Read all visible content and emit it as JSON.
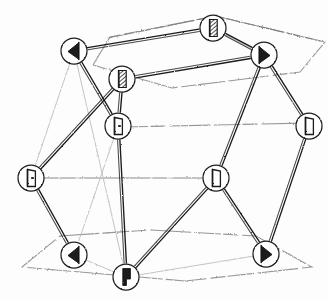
{
  "figure": {
    "caption": "",
    "background_color": "#fdfdfd",
    "ink_color": "#1a1a1a",
    "faint_ink_color": "#b9b9b9",
    "mid_ink_color": "#6f6f6f",
    "node_fill": "#ffffff",
    "node_stroke": "#1f1f1f"
  },
  "legend": {
    "glyph_names": {
      "flag-left-filled": "flag pointing left, solid",
      "flag-right-filled": "flag pointing right, solid",
      "flag-hatched": "flag with diagonal hatching",
      "flag-outline": "flag outline, empty",
      "flag-outline-dot": "flag outline with centre dot",
      "flag-vertical-solid": "vertical flag, solid black"
    }
  },
  "chart_data": {
    "type": "diagram",
    "layout": "cube-skeleton-graph",
    "node_radius": 13,
    "nodes": [
      {
        "id": "n1",
        "label": "",
        "x": 213,
        "y": 28,
        "glyph": "flag-hatched",
        "glyph_dir": "up"
      },
      {
        "id": "n2",
        "label": "",
        "x": 74,
        "y": 51,
        "glyph": "flag-left-filled",
        "glyph_dir": "left"
      },
      {
        "id": "n3",
        "label": "",
        "x": 264,
        "y": 55,
        "glyph": "flag-right-filled",
        "glyph_dir": "right"
      },
      {
        "id": "n4",
        "label": "",
        "x": 122,
        "y": 79,
        "glyph": "flag-hatched",
        "glyph_dir": "up"
      },
      {
        "id": "n5",
        "label": "",
        "x": 118,
        "y": 126,
        "glyph": "flag-outline-dot",
        "glyph_dir": "up"
      },
      {
        "id": "n6",
        "label": "",
        "x": 309,
        "y": 126,
        "glyph": "flag-outline",
        "glyph_dir": "up"
      },
      {
        "id": "n7",
        "label": "",
        "x": 31,
        "y": 178,
        "glyph": "flag-outline-dot",
        "glyph_dir": "up"
      },
      {
        "id": "n8",
        "label": "",
        "x": 216,
        "y": 178,
        "glyph": "flag-outline",
        "glyph_dir": "up"
      },
      {
        "id": "n9",
        "label": "",
        "x": 74,
        "y": 255,
        "glyph": "flag-left-filled",
        "glyph_dir": "left"
      },
      {
        "id": "n10",
        "label": "",
        "x": 266,
        "y": 254,
        "glyph": "flag-right-filled",
        "glyph_dir": "right"
      },
      {
        "id": "n11",
        "label": "",
        "x": 126,
        "y": 277,
        "glyph": "flag-vertical-solid",
        "glyph_dir": "up"
      }
    ],
    "edges_strong": [
      {
        "from": "n1",
        "to": "n3"
      },
      {
        "from": "n2",
        "to": "n1"
      },
      {
        "from": "n3",
        "to": "n4"
      },
      {
        "from": "n2",
        "to": "n5"
      },
      {
        "from": "n4",
        "to": "n7"
      },
      {
        "from": "n4",
        "to": "n5"
      },
      {
        "from": "n5",
        "to": "n11"
      },
      {
        "from": "n3",
        "to": "n6"
      },
      {
        "from": "n3",
        "to": "n8"
      },
      {
        "from": "n6",
        "to": "n10"
      },
      {
        "from": "n7",
        "to": "n9"
      },
      {
        "from": "n8",
        "to": "n11"
      },
      {
        "from": "n8",
        "to": "n10"
      }
    ],
    "edges_faint": [
      {
        "from": "n7",
        "to": "n8"
      },
      {
        "from": "n2",
        "to": "n7"
      },
      {
        "from": "n2",
        "to": "n11"
      },
      {
        "from": "n9",
        "to": "n11"
      },
      {
        "from": "n10",
        "to": "n11"
      },
      {
        "from": "n3",
        "to": "n1"
      },
      {
        "from": "n9",
        "to": "n5"
      }
    ],
    "frame_polylines": [
      {
        "name": "top-face",
        "points": "93,65 110,37 215,16 325,42 300,72 172,88 93,65"
      },
      {
        "name": "bottom-face",
        "points": "22,267 60,236 150,230 256,236 312,267 185,281 22,267"
      },
      {
        "name": "upper-band",
        "points": "108,38 216,16 320,41"
      },
      {
        "name": "mid-band",
        "points": "32,178 215,178"
      },
      {
        "name": "mid-band-2",
        "points": "122,127 308,123"
      }
    ]
  }
}
